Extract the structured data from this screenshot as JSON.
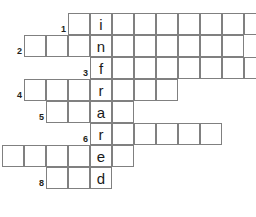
{
  "puzzle": {
    "title": "infrared crossword",
    "vertical_answer": "infrared",
    "cell_size": 22,
    "grid_origin": {
      "x": 2,
      "y": 13
    },
    "colors": {
      "cell_border": "#808080",
      "cell_fill": "#ffffff",
      "letter": "#1a1a1a",
      "number": "#231f20",
      "background": "#ffffff"
    },
    "letter_column": 4,
    "rows": [
      {
        "number": "1",
        "row_index": 0,
        "start_col": 3,
        "length": 9,
        "letter": "i",
        "letter_offset": 1
      },
      {
        "number": "2",
        "row_index": 1,
        "start_col": 1,
        "length": 10,
        "letter": "n",
        "letter_offset": 3
      },
      {
        "number": "3",
        "row_index": 2,
        "start_col": 4,
        "length": 8,
        "letter": "f",
        "letter_offset": 0
      },
      {
        "number": "4",
        "row_index": 3,
        "start_col": 1,
        "length": 7,
        "letter": "r",
        "letter_offset": 3
      },
      {
        "number": "5",
        "row_index": 4,
        "start_col": 2,
        "length": 4,
        "letter": "a",
        "letter_offset": 2
      },
      {
        "number": "6",
        "row_index": 5,
        "start_col": 4,
        "length": 6,
        "letter": "r",
        "letter_offset": 0
      },
      {
        "number": "7",
        "row_index": 6,
        "start_col": 0,
        "length": 6,
        "letter": "e",
        "letter_offset": 4
      },
      {
        "number": "8",
        "row_index": 7,
        "start_col": 2,
        "length": 3,
        "letter": "d",
        "letter_offset": 2
      }
    ],
    "numbers_visible": [
      "1",
      "2",
      "3",
      "4",
      "5",
      "6",
      "8"
    ]
  }
}
